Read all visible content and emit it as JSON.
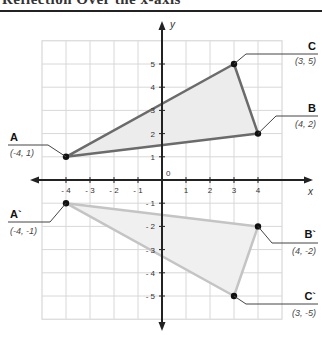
{
  "header": {
    "title": "Reflection Over the x-axis"
  },
  "chart_data": {
    "type": "scatter",
    "title": "Reflection Over the x-axis",
    "xlabel": "x",
    "ylabel": "y",
    "xlim": [
      -5,
      5
    ],
    "ylim": [
      -6,
      6
    ],
    "grid": true,
    "x_ticks": [
      "-4",
      "-3",
      "-2",
      "-1",
      "1",
      "2",
      "3",
      "4"
    ],
    "y_ticks": [
      "5",
      "4",
      "3",
      "2",
      "1",
      "-1",
      "-2",
      "-3",
      "-4",
      "-5"
    ],
    "origin_label": "0",
    "series": [
      {
        "name": "Triangle ABC (original)",
        "points": [
          {
            "label": "A",
            "coord": "(-4, 1)",
            "x": -4,
            "y": 1
          },
          {
            "label": "B",
            "coord": "(4, 2)",
            "x": 4,
            "y": 2
          },
          {
            "label": "C",
            "coord": "(3, 5)",
            "x": 3,
            "y": 5
          }
        ],
        "stroke": "#6b6b6b",
        "fill": "#ececec"
      },
      {
        "name": "Triangle A'B'C' (reflected)",
        "points": [
          {
            "label": "A`",
            "coord": "(-4, -1)",
            "x": -4,
            "y": -1
          },
          {
            "label": "B`",
            "coord": "(4, -2)",
            "x": 4,
            "y": -2
          },
          {
            "label": "C`",
            "coord": "(3, -5)",
            "x": 3,
            "y": -5
          }
        ],
        "stroke": "#c4c4c4",
        "fill": "#f0f0f0"
      }
    ]
  }
}
